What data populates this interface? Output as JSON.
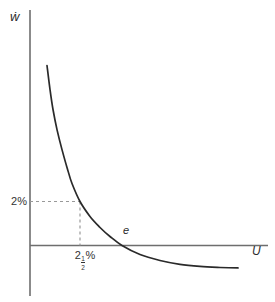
{
  "figure": {
    "ylabel": "ẇ",
    "xlabel": "U",
    "point_label": "e",
    "y_mark_label": "2%",
    "x_mark_label_plain": "2½%",
    "x_mark": {
      "whole": "2",
      "num": "1",
      "den": "2",
      "suffix": "%"
    }
  },
  "colors": {
    "background": "#ffffff",
    "curve": "#2a2a2a",
    "axis": "#6e6e6e",
    "dashed": "#999999",
    "text": "#333333"
  },
  "chart_data": {
    "type": "line",
    "title": "",
    "xlabel": "U",
    "ylabel": "ẇ",
    "grid": false,
    "legend": "none",
    "xlim": [
      0,
      11.9
    ],
    "ylim": [
      -2.3,
      10.7
    ],
    "series": [
      {
        "name": "downward-sloping convex curve (Phillips curve)",
        "x": [
          0.85,
          1.0,
          1.15,
          1.35,
          1.6,
          1.85,
          2.1,
          2.5,
          3.0,
          3.5,
          4.0,
          4.6,
          5.5,
          6.5,
          7.5,
          8.5,
          9.5,
          10.4
        ],
        "y": [
          8.18,
          7.09,
          6.18,
          5.27,
          4.36,
          3.55,
          2.82,
          2.0,
          1.32,
          0.82,
          0.41,
          0.0,
          -0.41,
          -0.68,
          -0.86,
          -0.95,
          -1.0,
          -1.02
        ]
      }
    ],
    "marked_point": {
      "x": 2.5,
      "y": 2.0,
      "x_label": "2½%",
      "y_label": "2%",
      "guides": "dashed lines from y-axis at 2% to curve, then down to x-axis at 2½%"
    },
    "annotations": [
      {
        "text": "e",
        "meaning": "point where curve crosses horizontal axis",
        "x": 4.6,
        "y": 0
      },
      {
        "text": "2%",
        "position": "y-axis mark"
      },
      {
        "text": "2½%",
        "position": "x-axis mark"
      }
    ]
  }
}
